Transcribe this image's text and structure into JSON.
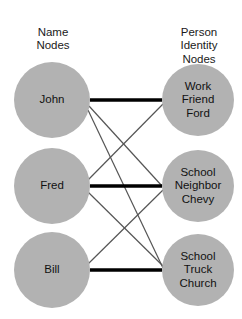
{
  "diagram": {
    "headers": {
      "left": "Name\nNodes",
      "right": "Person\nIdentity\nNodes"
    },
    "colors": {
      "node_fill": "#b2b2b2",
      "background": "#ffffff",
      "strong_edge": "#000000",
      "weak_edge": "#555555",
      "text": "#111111"
    },
    "name_nodes": [
      {
        "id": "john",
        "label": "John",
        "cx": 52,
        "cy": 100,
        "r": 38
      },
      {
        "id": "fred",
        "label": "Fred",
        "cx": 52,
        "cy": 186,
        "r": 38
      },
      {
        "id": "bill",
        "label": "Bill",
        "cx": 52,
        "cy": 270,
        "r": 38
      }
    ],
    "identity_nodes": [
      {
        "id": "work-friend-ford",
        "label": "Work\nFriend\nFord",
        "cx": 198,
        "cy": 100,
        "r": 36
      },
      {
        "id": "school-neighbor-chevy",
        "label": "School\nNeighbor\nChevy",
        "cx": 198,
        "cy": 186,
        "r": 36
      },
      {
        "id": "school-truck-church",
        "label": "School\nTruck\nChurch",
        "cx": 198,
        "cy": 270,
        "r": 36
      }
    ],
    "edges": [
      {
        "id": "john-work",
        "from": "john",
        "to": "work-friend-ford",
        "weight": "strong",
        "x1": 90,
        "y1": 100,
        "x2": 162,
        "y2": 100
      },
      {
        "id": "john-school-neighbor",
        "from": "john",
        "to": "school-neighbor-chevy",
        "weight": "weak",
        "x1": 89,
        "y1": 106,
        "x2": 162,
        "y2": 186
      },
      {
        "id": "john-school-truck",
        "from": "john",
        "to": "school-truck-church",
        "weight": "weak",
        "x1": 88,
        "y1": 110,
        "x2": 163,
        "y2": 268
      },
      {
        "id": "fred-work",
        "from": "fred",
        "to": "work-friend-ford",
        "weight": "weak",
        "x1": 88,
        "y1": 180,
        "x2": 163,
        "y2": 104
      },
      {
        "id": "fred-school-neighbor",
        "from": "fred",
        "to": "school-neighbor-chevy",
        "weight": "strong",
        "x1": 90,
        "y1": 186,
        "x2": 162,
        "y2": 186
      },
      {
        "id": "fred-school-truck",
        "from": "fred",
        "to": "school-truck-church",
        "weight": "weak",
        "x1": 88,
        "y1": 192,
        "x2": 163,
        "y2": 266
      },
      {
        "id": "bill-school-neighbor",
        "from": "bill",
        "to": "school-neighbor-chevy",
        "weight": "weak",
        "x1": 88,
        "y1": 264,
        "x2": 163,
        "y2": 190
      },
      {
        "id": "bill-school-truck",
        "from": "bill",
        "to": "school-truck-church",
        "weight": "strong",
        "x1": 90,
        "y1": 270,
        "x2": 162,
        "y2": 270
      }
    ]
  }
}
